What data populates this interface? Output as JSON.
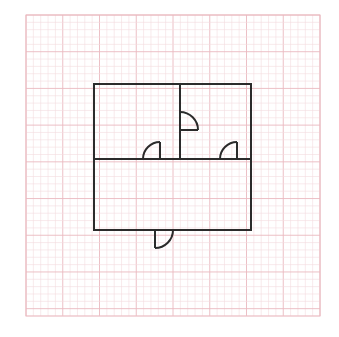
{
  "diagram": {
    "type": "floor-plan",
    "grid": {
      "x": 26,
      "y": 15,
      "width": 294,
      "height": 301,
      "minor_step": 7.35,
      "major_every": 5,
      "minor_color": "#f3dcdf",
      "major_color": "#eab9bf",
      "border_color": "#eab9bf"
    },
    "wall_color": "#2b2b2b",
    "wall_width": 2,
    "walls": [
      {
        "id": "outer-top",
        "x1": 94,
        "y1": 84,
        "x2": 251,
        "y2": 84
      },
      {
        "id": "outer-right",
        "x1": 251,
        "y1": 84,
        "x2": 251,
        "y2": 230
      },
      {
        "id": "outer-bottom",
        "x1": 94,
        "y1": 230,
        "x2": 251,
        "y2": 230
      },
      {
        "id": "outer-left",
        "x1": 94,
        "y1": 84,
        "x2": 94,
        "y2": 230
      },
      {
        "id": "interior-horizontal",
        "x1": 94,
        "y1": 159,
        "x2": 251,
        "y2": 159
      },
      {
        "id": "interior-vertical",
        "x1": 180,
        "y1": 84,
        "x2": 180,
        "y2": 159
      }
    ],
    "rooms": [
      {
        "id": "room-top-left",
        "x": 94,
        "y": 84,
        "w": 86,
        "h": 75
      },
      {
        "id": "room-top-right",
        "x": 180,
        "y": 84,
        "w": 71,
        "h": 75
      },
      {
        "id": "room-bottom",
        "x": 94,
        "y": 159,
        "w": 157,
        "h": 71
      }
    ],
    "doors": [
      {
        "id": "door-top-left-room",
        "hinge_x": 160,
        "hinge_y": 159,
        "radius": 17,
        "leaf": "up",
        "swing": "left"
      },
      {
        "id": "door-interior-vertical",
        "hinge_x": 180,
        "hinge_y": 130,
        "radius": 18,
        "leaf": "up",
        "swing": "right"
      },
      {
        "id": "door-top-right-room",
        "hinge_x": 237,
        "hinge_y": 159,
        "radius": 17,
        "leaf": "up",
        "swing": "left"
      },
      {
        "id": "door-entrance",
        "hinge_x": 155,
        "hinge_y": 230,
        "radius": 18,
        "leaf": "down",
        "swing": "right"
      }
    ]
  }
}
